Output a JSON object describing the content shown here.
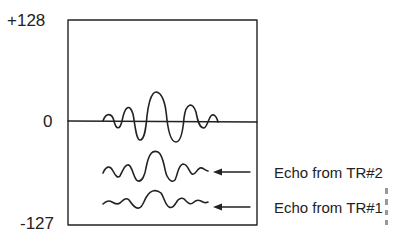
{
  "axis": {
    "top_label": "+128",
    "zero_label": "0",
    "bottom_label": "-127"
  },
  "annotations": [
    {
      "text": "Echo from TR#2",
      "target": "echo-tr2"
    },
    {
      "text": "Echo from TR#1",
      "target": "echo-tr1"
    }
  ],
  "waveforms": [
    {
      "name": "received-signal",
      "baseline": "0",
      "description": "Sum signal oscillating about zero line"
    },
    {
      "name": "echo-tr2",
      "description": "Larger echo waveform from TR#2"
    },
    {
      "name": "echo-tr1",
      "description": "Smaller echo waveform from TR#1"
    }
  ],
  "colors": {
    "line": "#222222",
    "background": "#ffffff"
  }
}
